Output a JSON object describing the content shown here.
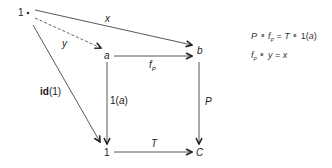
{
  "diagram": {
    "nodes": {
      "one_top": "1",
      "a": "a",
      "b": "b",
      "one_bottom": "1",
      "C": "C"
    },
    "arrows": {
      "x": "x",
      "y": "y",
      "fP": "f",
      "fP_sub": "P",
      "P": "P",
      "T": "T",
      "one_a_prefix": "1(",
      "one_a_var": "a",
      "one_a_suffix": ")",
      "id_bold": "id",
      "id_arg": "(1)"
    },
    "equations": {
      "eq1": {
        "P": "P",
        "circ1": " ∘ ",
        "f": "f",
        "sub": "P",
        "eqs": " = ",
        "T": "T",
        "circ2": " ∘ ",
        "one": "1(",
        "a": "a",
        "close": ")"
      },
      "eq2": {
        "f": "f",
        "sub": "P",
        "circ": " ∘ ",
        "y": "y",
        "eqs": " = ",
        "x": "x"
      }
    },
    "colors": {
      "stroke": "#444444",
      "text": "#222222"
    }
  }
}
